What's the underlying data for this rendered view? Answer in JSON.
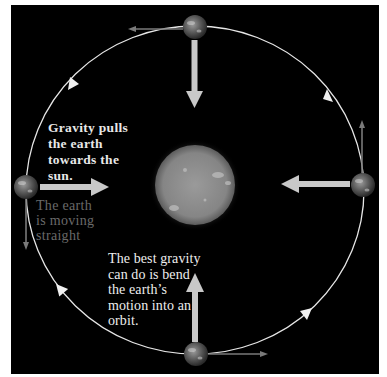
{
  "diagram": {
    "colors": {
      "background": "#000000",
      "frame": "#ffffff",
      "orbit": "#e6e6e6",
      "gravity_arrow": "#c8c8c8",
      "velocity_arrow": "#7a7a7a",
      "sun": "#8a8a8a",
      "earth": "#5a5a5a"
    },
    "sun": {
      "label": "sun",
      "cx": 195,
      "cy": 185,
      "r": 40
    },
    "orbit": {
      "cx": 195,
      "cy": 190,
      "rx": 169,
      "ry": 164,
      "direction": "counterclockwise"
    },
    "earths": [
      {
        "position": "top",
        "cx": 195,
        "cy": 27
      },
      {
        "position": "right",
        "cx": 363,
        "cy": 185
      },
      {
        "position": "bottom",
        "cx": 196,
        "cy": 354
      },
      {
        "position": "left",
        "cx": 26,
        "cy": 187
      }
    ],
    "labels": {
      "gravity": [
        "Gravity pulls",
        "the earth",
        "towards the",
        "sun."
      ],
      "straight": [
        "The earth",
        "is moving",
        "straight"
      ],
      "orbit": [
        "The best gravity",
        "can do is bend",
        "the earth’s",
        "motion into an",
        "orbit."
      ]
    }
  }
}
